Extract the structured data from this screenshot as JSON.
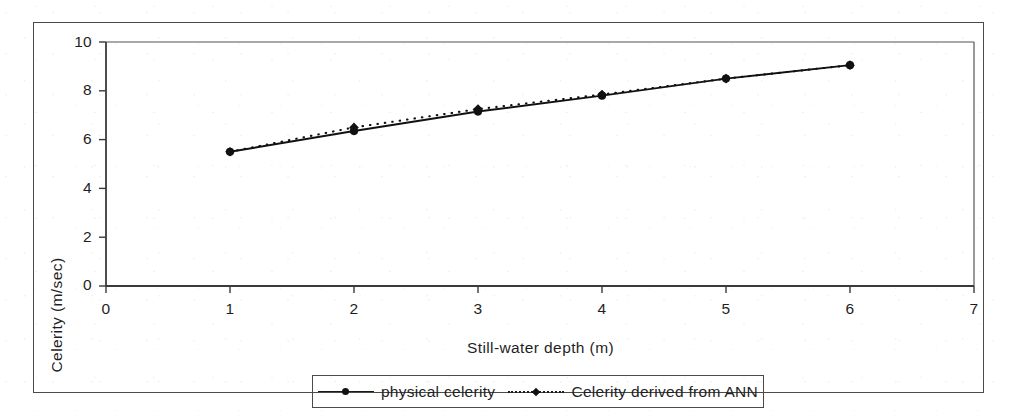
{
  "chart_data": {
    "type": "line",
    "title": "",
    "xlabel": "Still-water depth (m)",
    "ylabel": "Celerity (m/sec)",
    "xlim": [
      0,
      7
    ],
    "ylim": [
      0,
      10
    ],
    "xticks": [
      "0",
      "1",
      "2",
      "3",
      "4",
      "5",
      "6",
      "7"
    ],
    "yticks": [
      "0",
      "2",
      "4",
      "6",
      "8",
      "10"
    ],
    "x": [
      1,
      2,
      3,
      4,
      5,
      6
    ],
    "grid": false,
    "legend_position": "bottom",
    "series": [
      {
        "name": "physical celerity",
        "style": "solid",
        "marker": "circle",
        "color": "#111111",
        "values": [
          5.5,
          6.35,
          7.15,
          7.8,
          8.5,
          9.05
        ]
      },
      {
        "name": "Celerity derived from ANN",
        "style": "dotted",
        "marker": "diamond",
        "color": "#111111",
        "values": [
          5.5,
          6.5,
          7.25,
          7.85,
          8.5,
          9.05
        ]
      }
    ]
  },
  "axes": {
    "x_title": "Still-water depth (m)",
    "y_title": "Celerity (m/sec)"
  },
  "legend": {
    "entries": [
      {
        "label": "physical celerity"
      },
      {
        "label": "Celerity derived from ANN"
      }
    ]
  },
  "ticks": {
    "x": [
      "0",
      "1",
      "2",
      "3",
      "4",
      "5",
      "6",
      "7"
    ],
    "y": [
      "0",
      "2",
      "4",
      "6",
      "8",
      "10"
    ]
  }
}
